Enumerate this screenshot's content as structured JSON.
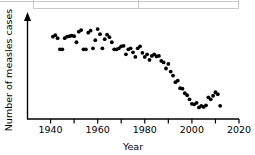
{
  "figure": {
    "kind": "scatter-plot",
    "background": "#ffffff",
    "point_color": "#000000",
    "axis_color": "#000000",
    "table_fragment_color": "#c9c9c9"
  },
  "chart_data": {
    "type": "scatter",
    "title": "",
    "xlabel": "Year",
    "ylabel": "Number of measles cases",
    "xlim": [
      1930,
      2020
    ],
    "ylim": [
      0,
      1
    ],
    "grid": false,
    "legend": null,
    "x_ticks_major": [
      1940,
      1960,
      1980,
      2000,
      2020
    ],
    "x_tick_labels": [
      "1940",
      "1960",
      "1980",
      "2000",
      "2020"
    ],
    "x_ticks_minor": [
      1950,
      1970,
      1990,
      2010
    ],
    "y_axis_numeric_labels": false,
    "y_axis_arrow": true,
    "series": [
      {
        "name": "Measles cases",
        "x": [
          1941,
          1942,
          1943,
          1944,
          1945,
          1946,
          1947,
          1948,
          1949,
          1950,
          1951,
          1952,
          1953,
          1954,
          1955,
          1956,
          1957,
          1958,
          1959,
          1960,
          1961,
          1962,
          1963,
          1964,
          1965,
          1966,
          1967,
          1968,
          1969,
          1970,
          1971,
          1972,
          1973,
          1974,
          1975,
          1976,
          1977,
          1978,
          1979,
          1980,
          1981,
          1982,
          1983,
          1984,
          1985,
          1986,
          1987,
          1988,
          1989,
          1990,
          1991,
          1992,
          1993,
          1994,
          1995,
          1996,
          1997,
          1998,
          1999,
          2000,
          2001,
          2002,
          2003,
          2004,
          2005,
          2006,
          2007,
          2008,
          2009,
          2010,
          2011,
          2012
        ],
        "y": [
          0.815,
          0.83,
          0.8,
          0.69,
          0.69,
          0.8,
          0.815,
          0.82,
          0.825,
          0.82,
          0.76,
          0.865,
          0.88,
          0.69,
          0.69,
          0.855,
          0.875,
          0.7,
          0.78,
          0.89,
          0.84,
          0.7,
          0.79,
          0.835,
          0.81,
          0.76,
          0.69,
          0.69,
          0.7,
          0.72,
          0.725,
          0.64,
          0.69,
          0.7,
          0.66,
          0.615,
          0.7,
          0.72,
          0.655,
          0.615,
          0.64,
          0.585,
          0.625,
          0.64,
          0.62,
          0.625,
          0.575,
          0.56,
          0.5,
          0.545,
          0.47,
          0.43,
          0.365,
          0.38,
          0.305,
          0.3,
          0.255,
          0.235,
          0.195,
          0.15,
          0.145,
          0.16,
          0.115,
          0.13,
          0.12,
          0.135,
          0.215,
          0.195,
          0.23,
          0.265,
          0.245,
          0.13
        ]
      }
    ]
  }
}
